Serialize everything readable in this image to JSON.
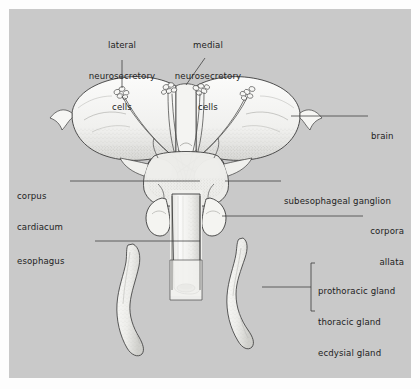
{
  "figure": {
    "domain": "anatomical-diagram",
    "background_color": "#c9c9c9",
    "panel_border_color": "#ffffff",
    "ink_color": "#2a2a2a",
    "text_color": "#1d1d1d",
    "organ_fill": "#f2f2f0"
  },
  "labels": {
    "lateral_cells": {
      "lines": [
        "lateral",
        "neurosecretory",
        "cells"
      ],
      "align": "center"
    },
    "medial_cells": {
      "lines": [
        "medial",
        "neurosecretory",
        "cells"
      ],
      "align": "center"
    },
    "brain": {
      "lines": [
        "brain"
      ],
      "align": "left"
    },
    "subesophageal_ganglion": {
      "lines": [
        "subesophageal ganglion"
      ],
      "align": "left"
    },
    "corpora_allata": {
      "lines": [
        "corpora",
        "allata"
      ],
      "align": "right"
    },
    "corpus_cardiacum": {
      "lines": [
        "corpus",
        "cardiacum"
      ],
      "align": "left"
    },
    "esophagus": {
      "lines": [
        "esophagus"
      ],
      "align": "left"
    },
    "gland_synonyms": {
      "lines": [
        "prothoracic gland",
        "thoracic gland",
        "ecdysial gland"
      ],
      "align": "left",
      "bracket": true
    }
  },
  "structures": [
    {
      "name": "brain",
      "description": "paired butterfly-shaped cerebral lobes"
    },
    {
      "name": "lateral-neurosecretory-cell-cluster-left",
      "description": "cluster of cell bodies in left lobe"
    },
    {
      "name": "lateral-neurosecretory-cell-cluster-right",
      "description": "cluster of cell bodies in right lobe"
    },
    {
      "name": "medial-neurosecretory-cell-cluster-left",
      "description": "medial cluster left of midline"
    },
    {
      "name": "medial-neurosecretory-cell-cluster-right",
      "description": "medial cluster right of midline"
    },
    {
      "name": "axon-decussation",
      "description": "crossing axon tracts to contralateral corpus cardiacum"
    },
    {
      "name": "corpus-cardiacum",
      "description": "paired neurohaemal organ behind brain"
    },
    {
      "name": "subesophageal-ganglion",
      "description": "ganglion beneath the esophagus"
    },
    {
      "name": "corpora-allata",
      "description": "paired rounded endocrine bodies flanking esophagus"
    },
    {
      "name": "esophagus",
      "description": "median tube passing posteriorly"
    },
    {
      "name": "prothoracic-gland-left",
      "description": "elongated ribbon-like gland"
    },
    {
      "name": "prothoracic-gland-right",
      "description": "elongated ribbon-like gland"
    }
  ]
}
